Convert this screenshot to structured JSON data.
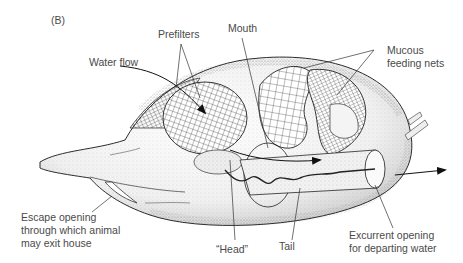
{
  "figure": {
    "panel_label": "(B)",
    "labels": {
      "prefilters": "Prefilters",
      "mouth": "Mouth",
      "mucous_nets_line1": "Mucous",
      "mucous_nets_line2": "feeding nets",
      "water_flow": "Water flow",
      "escape_line1": "Escape opening",
      "escape_line2": "through which animal",
      "escape_line3": "may exit house",
      "head": "“Head”",
      "tail": "Tail",
      "excurrent_line1": "Excurrent opening",
      "excurrent_line2": "for departing water"
    },
    "colors": {
      "ink": "#1a1a1a",
      "label_text": "#4a4a4a",
      "stipple": "#9a9a9a",
      "background": "#ffffff"
    }
  }
}
